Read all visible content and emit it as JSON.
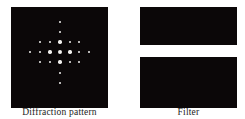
{
  "figure": {
    "left_panel": {
      "caption": "Diffraction pattern",
      "box": {
        "x": 11,
        "y": 7,
        "w": 97,
        "h": 101
      },
      "background": "#0b0708",
      "dot_color": "#f2f0ee",
      "dots": [
        {
          "x": 60,
          "y": 22,
          "d": 2.2
        },
        {
          "x": 60,
          "y": 32,
          "d": 2.6
        },
        {
          "x": 40,
          "y": 42,
          "d": 2.4
        },
        {
          "x": 50,
          "y": 42,
          "d": 2.8
        },
        {
          "x": 60,
          "y": 42,
          "d": 3.4
        },
        {
          "x": 70,
          "y": 42,
          "d": 2.8
        },
        {
          "x": 79,
          "y": 42,
          "d": 2.4
        },
        {
          "x": 30,
          "y": 52,
          "d": 2.2
        },
        {
          "x": 40,
          "y": 52,
          "d": 2.8
        },
        {
          "x": 50,
          "y": 52,
          "d": 3.4
        },
        {
          "x": 60,
          "y": 52,
          "d": 4.4
        },
        {
          "x": 70,
          "y": 52,
          "d": 3.4
        },
        {
          "x": 79,
          "y": 52,
          "d": 2.8
        },
        {
          "x": 89,
          "y": 52,
          "d": 2.2
        },
        {
          "x": 40,
          "y": 62,
          "d": 2.4
        },
        {
          "x": 50,
          "y": 62,
          "d": 2.8
        },
        {
          "x": 60,
          "y": 62,
          "d": 3.4
        },
        {
          "x": 70,
          "y": 62,
          "d": 2.8
        },
        {
          "x": 79,
          "y": 62,
          "d": 2.4
        },
        {
          "x": 60,
          "y": 73,
          "d": 2.6
        },
        {
          "x": 60,
          "y": 83,
          "d": 2.2
        }
      ]
    },
    "right_panel": {
      "caption": "Filter",
      "rects": [
        {
          "x": 140,
          "y": 7,
          "w": 97,
          "h": 38
        },
        {
          "x": 140,
          "y": 57,
          "w": 97,
          "h": 51
        }
      ],
      "background": "#0b0708"
    }
  }
}
